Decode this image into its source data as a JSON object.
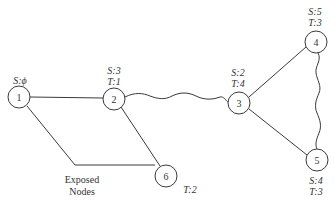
{
  "diagram": {
    "nodes": [
      {
        "id": "1",
        "label": "1",
        "x": 19,
        "y": 97,
        "annotations": [
          "S:ϕ"
        ],
        "ann_pos": "above"
      },
      {
        "id": "2",
        "label": "2",
        "x": 114,
        "y": 99,
        "annotations": [
          "S:3",
          "T:1"
        ],
        "ann_pos": "above"
      },
      {
        "id": "3",
        "label": "3",
        "x": 239,
        "y": 103,
        "annotations": [
          "S:2",
          "T:4"
        ],
        "ann_pos": "above"
      },
      {
        "id": "4",
        "label": "4",
        "x": 316,
        "y": 42,
        "annotations": [
          "S:5",
          "T:3"
        ],
        "ann_pos": "above"
      },
      {
        "id": "5",
        "label": "5",
        "x": 317,
        "y": 160,
        "annotations": [
          "S:4",
          "T:3"
        ],
        "ann_pos": "below"
      },
      {
        "id": "6",
        "label": "6",
        "x": 166,
        "y": 176,
        "annotations": [
          "T:2"
        ],
        "ann_pos": "below-right"
      }
    ],
    "edges": [
      {
        "from": "1",
        "to": "2",
        "style": "straight"
      },
      {
        "from": "2",
        "to": "3",
        "style": "wavy"
      },
      {
        "from": "2",
        "to": "6",
        "style": "straight"
      },
      {
        "from": "3",
        "to": "4",
        "style": "straight"
      },
      {
        "from": "3",
        "to": "5",
        "style": "straight"
      },
      {
        "from": "4",
        "to": "5",
        "style": "wavy"
      }
    ],
    "callout": {
      "line1": "Exposed",
      "line2": "Nodes",
      "points_to": [
        "1",
        "6"
      ]
    }
  }
}
